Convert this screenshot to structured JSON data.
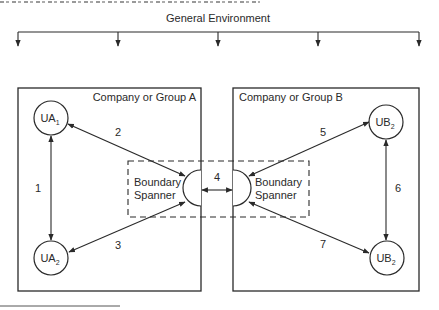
{
  "diagram": {
    "environment": {
      "label": "General Environment",
      "bar": {
        "x1": 18,
        "x2": 419,
        "y": 32
      },
      "arrow_drops_x": [
        18,
        118,
        218,
        318,
        419
      ],
      "arrow_drop_to_y": 46
    },
    "groups": [
      {
        "id": "A",
        "label": "Company or Group A",
        "x": 18,
        "y": 88,
        "w": 183,
        "h": 203
      },
      {
        "id": "B",
        "label": "Company or Group B",
        "x": 233,
        "y": 88,
        "w": 186,
        "h": 203
      }
    ],
    "boundary_zone": {
      "x": 128,
      "y": 161,
      "w": 181,
      "h": 56
    },
    "boundary_spanners": [
      {
        "id": "BS-A",
        "label_line1": "Boundary",
        "label_line2": "Spanner",
        "cx": 201,
        "cy": 188,
        "r": 18,
        "side": "left"
      },
      {
        "id": "BS-B",
        "label_line1": "Boundary",
        "label_line2": "Spanner",
        "cx": 233,
        "cy": 188,
        "r": 18,
        "side": "right"
      }
    ],
    "units": [
      {
        "id": "UA1",
        "main": "UA",
        "sub": "1",
        "cx": 51,
        "cy": 118,
        "r": 17
      },
      {
        "id": "UA2",
        "main": "UA",
        "sub": "2",
        "cx": 51,
        "cy": 258,
        "r": 17
      },
      {
        "id": "UB2-top",
        "main": "UB",
        "sub": "2",
        "cx": 386,
        "cy": 122,
        "r": 17
      },
      {
        "id": "UB2-bottom",
        "main": "UB",
        "sub": "2",
        "cx": 387,
        "cy": 258,
        "r": 17
      }
    ],
    "links": [
      {
        "number": "1",
        "x1": 51,
        "y1": 136,
        "x2": 51,
        "y2": 240,
        "label_x": 38,
        "label_y": 192
      },
      {
        "number": "2",
        "x1": 68,
        "y1": 124,
        "x2": 185,
        "y2": 176,
        "label_x": 118,
        "label_y": 136
      },
      {
        "number": "3",
        "x1": 69,
        "y1": 252,
        "x2": 185,
        "y2": 202,
        "label_x": 118,
        "label_y": 249
      },
      {
        "number": "4",
        "x1": 202,
        "y1": 190,
        "x2": 232,
        "y2": 190,
        "label_x": 217,
        "label_y": 181
      },
      {
        "number": "5",
        "x1": 249,
        "y1": 176,
        "x2": 369,
        "y2": 122,
        "label_x": 323,
        "label_y": 136
      },
      {
        "number": "6",
        "x1": 386,
        "y1": 140,
        "x2": 386,
        "y2": 240,
        "label_x": 398,
        "label_y": 192
      },
      {
        "number": "7",
        "x1": 249,
        "y1": 202,
        "x2": 369,
        "y2": 253,
        "label_x": 323,
        "label_y": 248
      }
    ],
    "footnote_rule": {
      "x1": 0,
      "x2": 120,
      "y": 306
    },
    "colors": {
      "stroke": "#2a2a2a",
      "text": "#2a2a2a",
      "background": "#ffffff"
    }
  }
}
